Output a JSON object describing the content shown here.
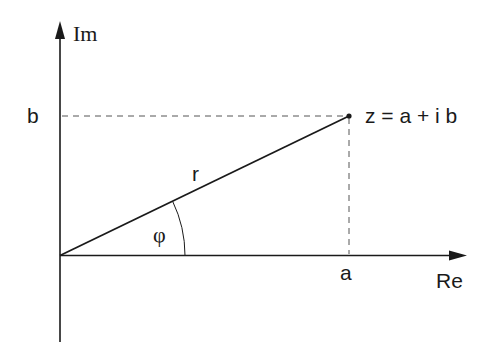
{
  "diagram": {
    "axes": {
      "real_label": "Re",
      "imag_label": "Im"
    },
    "labels": {
      "b": "b",
      "a": "a",
      "r": "r",
      "phi": "φ",
      "point": "z = a + i b"
    },
    "colors": {
      "line": "#1a1a1a",
      "dashed": "#555555",
      "background": "#ffffff"
    }
  }
}
